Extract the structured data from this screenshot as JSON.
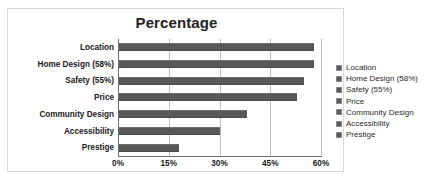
{
  "chart_data": {
    "type": "bar",
    "orientation": "horizontal",
    "title": "Percentage",
    "xlabel": "",
    "ylabel": "",
    "categories": [
      "Location",
      "Home Design (58%)",
      "Safety (55%)",
      "Price",
      "Community Design",
      "Accessibility",
      "Prestige"
    ],
    "values": [
      58,
      58,
      55,
      53,
      38,
      30,
      18
    ],
    "xlim": [
      0,
      60
    ],
    "xticks": [
      0,
      15,
      30,
      45,
      60
    ],
    "xtick_labels": [
      "0%",
      "15%",
      "30%",
      "45%",
      "60%"
    ],
    "grid": true,
    "legend_position": "right",
    "legend_entries": [
      "Location",
      "Home Design (58%)",
      "Safety (55%)",
      "Price",
      "Community Design",
      "Accessibility",
      "Prestige"
    ],
    "bar_color": "#585858",
    "gridline_color": "#bfbfbf",
    "axis_color": "#6f6f6f",
    "border_color": "#d9d9d9",
    "background_color": "#ffffff"
  }
}
